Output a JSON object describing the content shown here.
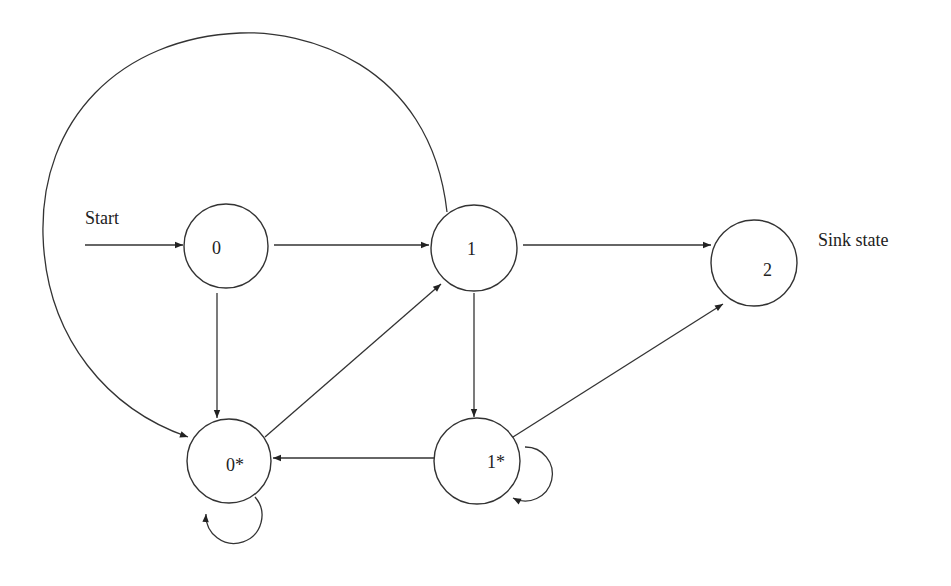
{
  "diagram": {
    "type": "state-transition-diagram",
    "start_label": "Start",
    "sink_label": "Sink state",
    "states": [
      {
        "id": "s0",
        "label": "0",
        "cx": 226,
        "cy": 246,
        "r": 42
      },
      {
        "id": "s1",
        "label": "1",
        "cx": 474,
        "cy": 248,
        "r": 43
      },
      {
        "id": "s2",
        "label": "2",
        "cx": 754,
        "cy": 263,
        "r": 43
      },
      {
        "id": "s0star",
        "label": "0*",
        "cx": 229,
        "cy": 461,
        "r": 42
      },
      {
        "id": "s1star",
        "label": "1*",
        "cx": 477,
        "cy": 461,
        "r": 43
      }
    ],
    "transitions": [
      {
        "from": "start",
        "to": "0"
      },
      {
        "from": "0",
        "to": "1"
      },
      {
        "from": "0",
        "to": "0*"
      },
      {
        "from": "1",
        "to": "2"
      },
      {
        "from": "1",
        "to": "1*"
      },
      {
        "from": "1",
        "to": "0*",
        "shape": "large arc over top"
      },
      {
        "from": "0*",
        "to": "1"
      },
      {
        "from": "0*",
        "to": "0*",
        "shape": "self-loop"
      },
      {
        "from": "1*",
        "to": "0*"
      },
      {
        "from": "1*",
        "to": "2"
      },
      {
        "from": "1*",
        "to": "1*",
        "shape": "self-loop"
      }
    ],
    "colors": {
      "stroke": "#333333",
      "background": "#ffffff"
    }
  }
}
